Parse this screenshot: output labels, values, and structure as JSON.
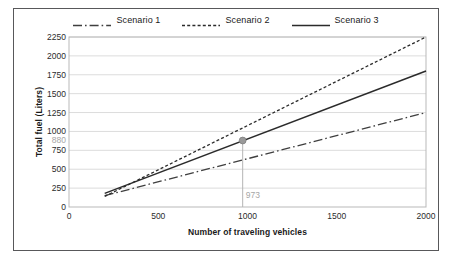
{
  "chart_data": {
    "type": "line",
    "title": "",
    "xlabel": "Number of traveling vehicles",
    "ylabel": "Total fuel (Liters)",
    "xlim": [
      0,
      2000
    ],
    "ylim": [
      0,
      2250
    ],
    "xticks": [
      0,
      500,
      1000,
      1500,
      2000
    ],
    "yticks": [
      0,
      250,
      500,
      750,
      1000,
      1250,
      1500,
      1750,
      2000,
      2250
    ],
    "grid": "horizontal",
    "legend_position": "top-center",
    "series": [
      {
        "name": "Scenario 1",
        "style": "dash-dot",
        "color": "#3f3f3f",
        "x": [
          200,
          2000
        ],
        "y": [
          150,
          1250
        ]
      },
      {
        "name": "Scenario 2",
        "style": "dashed",
        "color": "#2b2b2b",
        "x": [
          200,
          2000
        ],
        "y": [
          140,
          2250
        ]
      },
      {
        "name": "Scenario 3",
        "style": "solid",
        "color": "#2b2b2b",
        "x": [
          200,
          2000
        ],
        "y": [
          180,
          1800
        ]
      }
    ],
    "annotations": [
      {
        "name": "intersection-point",
        "x": 973,
        "y": 880,
        "x_label": "973",
        "y_label": "880",
        "marker": "circle",
        "marker_color": "#9a9a9a",
        "dropline": true,
        "dropline_color": "#b5b5b5"
      }
    ]
  },
  "legend": {
    "items": [
      {
        "label": "Scenario 1"
      },
      {
        "label": "Scenario 2"
      },
      {
        "label": "Scenario 3"
      }
    ]
  },
  "axes": {
    "y_title": "Total fuel (Liters)",
    "x_title": "Number of traveling vehicles",
    "y_tick_labels": [
      "2250",
      "2000",
      "1750",
      "1500",
      "1250",
      "1000",
      "750",
      "500",
      "250",
      "0"
    ],
    "x_tick_labels": [
      "0",
      "500",
      "1000",
      "1500",
      "2000"
    ]
  },
  "annotations": {
    "y_value": "880",
    "x_value": "973"
  }
}
